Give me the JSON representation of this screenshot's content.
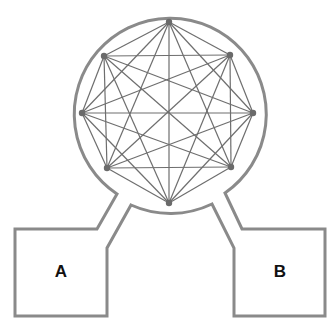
{
  "diagram": {
    "type": "complete-graph-in-circle-with-two-chambers",
    "graph": {
      "kind": "complete graph K8",
      "node_count": 8,
      "nodes": [
        {
          "id": "n0",
          "x": 169,
          "y": 22
        },
        {
          "id": "n1",
          "x": 230,
          "y": 55
        },
        {
          "id": "n2",
          "x": 253,
          "y": 113
        },
        {
          "id": "n3",
          "x": 231,
          "y": 167
        },
        {
          "id": "n4",
          "x": 169,
          "y": 203
        },
        {
          "id": "n5",
          "x": 107,
          "y": 168
        },
        {
          "id": "n6",
          "x": 82,
          "y": 113
        },
        {
          "id": "n7",
          "x": 104,
          "y": 56
        }
      ]
    },
    "chambers": [
      {
        "id": "A",
        "label": "A",
        "label_x": 61,
        "label_y": 277
      },
      {
        "id": "B",
        "label": "B",
        "label_x": 280,
        "label_y": 277
      }
    ],
    "colors": {
      "outline": "#8a8a8a",
      "edge": "#6e6e6e",
      "node": "#6a6a6a",
      "label": "#111111"
    }
  }
}
